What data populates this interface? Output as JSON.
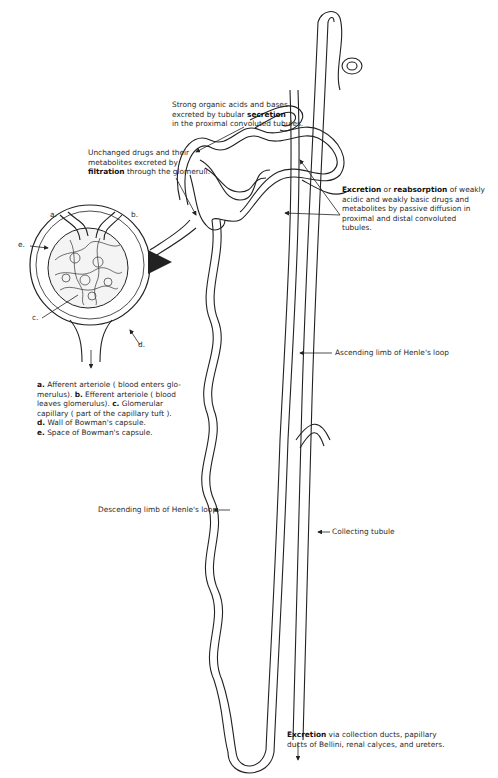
{
  "diagram": {
    "labels": {
      "secretion": {
        "line1": "Strong organic acids and bases",
        "line2_pre": "excreted by tubular ",
        "line2_bold": "secretion",
        "line3": "in the proximal convoluted tubules."
      },
      "filtration": {
        "line1": "Unchanged drugs and their",
        "line2": "metabolites excreted by",
        "line3_bold": "filtration",
        "line3_post": " through the glomeruli."
      },
      "reabsorption": {
        "line1_bold1": "Excretion",
        "line1_mid": " or ",
        "line1_bold2": "reabsorption",
        "line1_post": " of weakly",
        "line2": "acidic and weakly basic drugs and",
        "line3": "metabolites by passive diffusion in",
        "line4": "proximal and distal convoluted",
        "line5": "tubules."
      },
      "ascending": "Ascending limb of Henle's loop",
      "descending": "Descending limb of Henle's loop.",
      "collecting": "Collecting tubule",
      "final_excretion": {
        "line1_bold": "Excretion",
        "line1_post": " via collection ducts, papillary",
        "line2": "ducts of Bellini, renal calyces, and ureters."
      },
      "glomerulus_letters": {
        "a": "a.",
        "b": "b.",
        "c": "c.",
        "d": "d.",
        "e": "e."
      }
    },
    "legend": [
      {
        "key": "a.",
        "text": " Afferent arteriole ( blood enters glo-"
      },
      {
        "key": "",
        "text": "merulus). "
      },
      {
        "key": "b.",
        "text": " Efferent arteriole ( blood"
      },
      {
        "key": "",
        "text": "leaves glomerulus). "
      },
      {
        "key": "c.",
        "text": " Glomerular"
      },
      {
        "key": "",
        "text": "capillary ( part of the capillary tuft )."
      },
      {
        "key": "d.",
        "text": " Wall of Bowman's capsule."
      },
      {
        "key": "e.",
        "text": " Space of Bowman's capsule."
      }
    ]
  }
}
